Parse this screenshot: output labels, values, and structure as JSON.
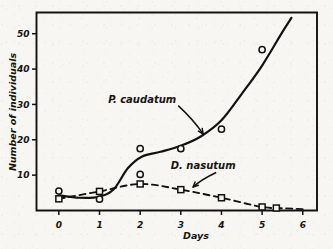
{
  "chart_data": {
    "type": "scatter",
    "title": "",
    "xlabel": "Days",
    "ylabel": "Number of individuals",
    "xlim": [
      -0.55,
      6.35
    ],
    "ylim": [
      0,
      56
    ],
    "xticks": [
      0,
      1,
      2,
      3,
      4,
      5,
      6
    ],
    "xtick_labels": [
      "0",
      "1",
      "2",
      "3",
      "4",
      "5",
      "6"
    ],
    "yticks": [
      10,
      20,
      30,
      40,
      50
    ],
    "ytick_labels": [
      "10",
      "20",
      "30",
      "40",
      "50"
    ],
    "grid": false,
    "legend": "inline-annotations",
    "series": [
      {
        "name": "P. caudatum",
        "marker": "open-circle",
        "line": "solid",
        "label": "P. caudatum",
        "points": [
          {
            "x": 0,
            "y": 5.5
          },
          {
            "x": 1,
            "y": 3.2
          },
          {
            "x": 2,
            "y": 17.5
          },
          {
            "x": 2,
            "y": 10.2
          },
          {
            "x": 3,
            "y": 17.5
          },
          {
            "x": 4,
            "y": 23.0
          },
          {
            "x": 5,
            "y": 45.5
          }
        ],
        "curve": [
          {
            "x": 0,
            "y": 4.3
          },
          {
            "x": 0.5,
            "y": 3.6
          },
          {
            "x": 1,
            "y": 3.9
          },
          {
            "x": 1.35,
            "y": 6.0
          },
          {
            "x": 1.7,
            "y": 12.0
          },
          {
            "x": 2.05,
            "y": 15.3
          },
          {
            "x": 2.5,
            "y": 16.6
          },
          {
            "x": 3,
            "y": 18.3
          },
          {
            "x": 3.5,
            "y": 21.0
          },
          {
            "x": 4,
            "y": 25.5
          },
          {
            "x": 4.5,
            "y": 33.0
          },
          {
            "x": 5,
            "y": 41.0
          },
          {
            "x": 5.5,
            "y": 50.5
          },
          {
            "x": 5.72,
            "y": 54.5
          }
        ]
      },
      {
        "name": "D. nasutum",
        "marker": "open-square",
        "line": "dashed",
        "label": "D. nasutum",
        "points": [
          {
            "x": 0,
            "y": 3.3
          },
          {
            "x": 1,
            "y": 5.4
          },
          {
            "x": 2,
            "y": 7.5
          },
          {
            "x": 3,
            "y": 5.9
          },
          {
            "x": 4,
            "y": 3.6
          },
          {
            "x": 5,
            "y": 1.0
          },
          {
            "x": 5.35,
            "y": 0.7
          }
        ],
        "curve": [
          {
            "x": 0,
            "y": 3.3
          },
          {
            "x": 1,
            "y": 5.4
          },
          {
            "x": 2,
            "y": 7.5
          },
          {
            "x": 3,
            "y": 5.9
          },
          {
            "x": 4,
            "y": 3.6
          },
          {
            "x": 5,
            "y": 1.0
          },
          {
            "x": 5.6,
            "y": 0.6
          },
          {
            "x": 6.0,
            "y": 0.4
          }
        ]
      }
    ],
    "annotations": [
      {
        "text": "P. caudatum",
        "x": 2.05,
        "y": 30.5,
        "arrow_to": {
          "x": 3.55,
          "y": 21.6
        }
      },
      {
        "text": "D. nasutum",
        "x": 3.55,
        "y": 11.6,
        "arrow_to": {
          "x": 3.3,
          "y": 6.6
        }
      }
    ]
  }
}
